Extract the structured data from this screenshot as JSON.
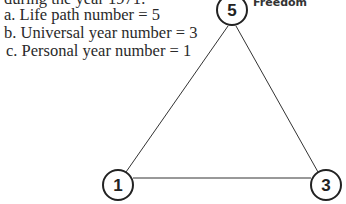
{
  "intro_line": "during the year 1971:",
  "items": [
    {
      "marker": "a.",
      "label": "Life path number",
      "value": "5",
      "text": "a.  Life path number = 5"
    },
    {
      "marker": "b.",
      "label": "Universal year number",
      "value": "3",
      "text": "b.  Universal year number = 3"
    },
    {
      "marker": "c.",
      "label": "Personal year number",
      "value": "1",
      "text": "c.  Personal year number = 1"
    }
  ],
  "triangle": {
    "top": {
      "number": "5",
      "label": "Freedom"
    },
    "bottom_left": {
      "number": "1"
    },
    "bottom_right": {
      "number": "3"
    }
  }
}
